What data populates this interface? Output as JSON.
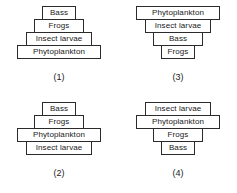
{
  "figure": {
    "diagrams": [
      {
        "id": "pyramid-1",
        "caption": "(1)",
        "tiers": [
          {
            "label": "Bass",
            "width_class": "w1"
          },
          {
            "label": "Frogs",
            "width_class": "w2"
          },
          {
            "label": "Insect larvae",
            "width_class": "w3"
          },
          {
            "label": "Phytoplankton",
            "width_class": "w4"
          }
        ]
      },
      {
        "id": "pyramid-3",
        "caption": "(3)",
        "tiers": [
          {
            "label": "Phytoplankton",
            "width_class": "w4"
          },
          {
            "label": "Insect larvae",
            "width_class": "w3"
          },
          {
            "label": "Bass",
            "width_class": "w2"
          },
          {
            "label": "Frogs",
            "width_class": "w1"
          }
        ]
      },
      {
        "id": "pyramid-2",
        "caption": "(2)",
        "tiers": [
          {
            "label": "Bass",
            "width_class": "w1"
          },
          {
            "label": "Frogs",
            "width_class": "w2"
          },
          {
            "label": "Phytoplankton",
            "width_class": "w4"
          },
          {
            "label": "Insect larvae",
            "width_class": "w3"
          }
        ]
      },
      {
        "id": "pyramid-4",
        "caption": "(4)",
        "tiers": [
          {
            "label": "Insect larvae",
            "width_class": "w3"
          },
          {
            "label": "Phytoplankton",
            "width_class": "w4"
          },
          {
            "label": "Frogs",
            "width_class": "w2"
          },
          {
            "label": "Bass",
            "width_class": "w1"
          }
        ]
      }
    ]
  }
}
